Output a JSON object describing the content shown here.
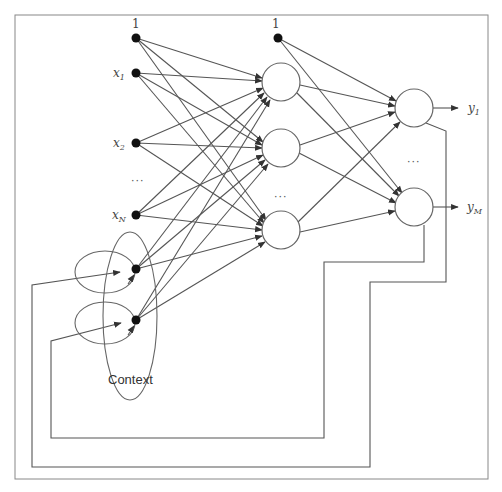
{
  "diagram": {
    "colors": {
      "line": "#555555",
      "node_fill": "#ffffff",
      "node_stroke": "#666666",
      "dot": "#111111",
      "border": "#777777"
    },
    "input_layer": {
      "bias_label": "1",
      "inputs": [
        {
          "label": "x",
          "sub": "1"
        },
        {
          "label": "x",
          "sub": "2"
        },
        {
          "label": "x",
          "sub": "N"
        }
      ],
      "ellipsis": "···"
    },
    "hidden_layer": {
      "bias_label": "1",
      "node_count_shown": 3,
      "ellipsis": "···"
    },
    "output_layer": {
      "outputs": [
        {
          "label": "y",
          "sub": "1"
        },
        {
          "label": "y",
          "sub": "M"
        }
      ],
      "ellipsis": "···"
    },
    "context": {
      "label": "Context",
      "node_count_shown": 2
    }
  }
}
